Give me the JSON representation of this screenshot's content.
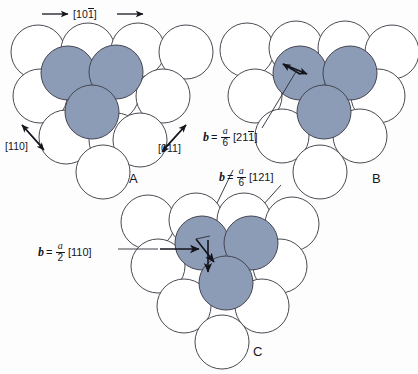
{
  "figure": {
    "background_color": "#fdfdfd",
    "atom_open_fill": "#ffffff",
    "atom_shaded_fill": "#8c9cb6",
    "outline_color": "#4a4a52"
  },
  "panels": [
    {
      "id": "A",
      "label": "A"
    },
    {
      "id": "B",
      "label": "B"
    },
    {
      "id": "C",
      "label": "C"
    }
  ],
  "directions": {
    "top": {
      "label_prefix": "[10",
      "label_overbar": "1",
      "label_suffix": "]",
      "full": "[101̄]"
    },
    "left": {
      "full": "[110]"
    },
    "right": {
      "full": "[011]"
    }
  },
  "burgers_vectors": [
    {
      "symbol": "b",
      "equals": "=",
      "numerator": "a",
      "denominator": "6",
      "index_prefix": "[21",
      "index_overbar": "1",
      "index_suffix": "]",
      "full": "b = a/6 [211̄]"
    },
    {
      "symbol": "b",
      "equals": "=",
      "numerator": "a",
      "denominator": "6",
      "index_prefix": "[121",
      "index_overbar": "",
      "index_suffix": "]",
      "full": "b = a/6 [121]"
    },
    {
      "symbol": "b",
      "equals": "=",
      "numerator": "a",
      "denominator": "2",
      "index_prefix": "[110",
      "index_overbar": "",
      "index_suffix": "]",
      "full": "b = a/2 [110]"
    }
  ]
}
